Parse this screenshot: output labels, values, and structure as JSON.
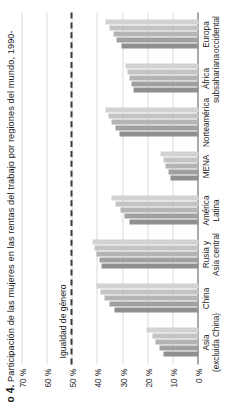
{
  "figure": {
    "number_label": "o 4.",
    "title": "Participación de las mujeres en las rentas del trabajo por regiones del mundo, 1990-",
    "full_title_visible": "o 4. Participación de las mujeres en las rentas del trabajo por regiones del mundo, 1990-"
  },
  "annotations": {
    "parity_label": "Igualdad de género",
    "parity_value": 50
  },
  "axis": {
    "y_ticks": [
      "0 %",
      "10 %",
      "20 %",
      "30 %",
      "40 %",
      "50 %",
      "60 %",
      "70 %"
    ]
  },
  "chart_data": {
    "type": "bar",
    "title": "o 4. Participación de las mujeres en las rentas del trabajo por regiones del mundo, 1990-",
    "xlabel": "",
    "ylabel": "",
    "ylim": [
      0,
      70
    ],
    "grid": true,
    "legend": "none-visible",
    "orientation": "vertical-bars-in-rotated-page",
    "categories": [
      "Asia\n(excluida China)",
      "China",
      "Rusia y\nAsia central",
      "América\nLatina",
      "MENA",
      "Norteamérica",
      "África\nsubsahariana",
      "Europa\noccidental"
    ],
    "series": [
      {
        "name": "periodo-1",
        "shade": "#8f8f8f",
        "values": [
          14.0,
          33.5,
          38.5,
          27.5,
          11.0,
          31.5,
          26.0,
          30.5
        ]
      },
      {
        "name": "periodo-2",
        "shade": "#a0a0a0",
        "values": [
          15.5,
          35.5,
          39.5,
          29.5,
          12.0,
          33.0,
          26.8,
          32.5
        ]
      },
      {
        "name": "periodo-3",
        "shade": "#b4b4b4",
        "values": [
          17.0,
          37.5,
          40.5,
          31.0,
          13.0,
          34.5,
          27.6,
          34.0
        ]
      },
      {
        "name": "periodo-4",
        "shade": "#c4c4c4",
        "values": [
          18.5,
          39.0,
          41.5,
          33.0,
          14.0,
          35.8,
          28.3,
          35.5
        ]
      },
      {
        "name": "periodo-5",
        "shade": "#d2d2d2",
        "values": [
          20.5,
          40.5,
          42.0,
          34.5,
          15.0,
          37.0,
          29.0,
          36.8
        ]
      }
    ],
    "parity_line": {
      "value": 50,
      "label": "Igualdad de género",
      "style": "dashed"
    }
  }
}
